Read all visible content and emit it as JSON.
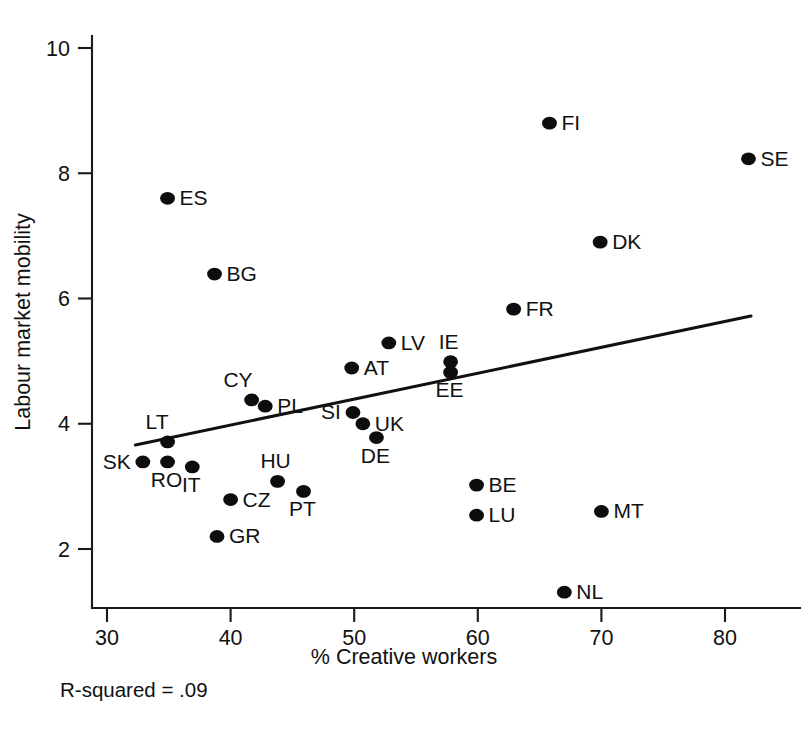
{
  "chart_data": {
    "type": "scatter",
    "title": "",
    "xlabel": "% Creative workers",
    "ylabel": "Labour market mobility",
    "xlim": [
      28.5,
      84.5
    ],
    "ylim": [
      1.0,
      10.6
    ],
    "xticks": [
      30,
      40,
      50,
      60,
      70,
      80
    ],
    "yticks": [
      2,
      4,
      6,
      8,
      10
    ],
    "grid": false,
    "legend": null,
    "annotations": [
      {
        "name": "r-squared-note",
        "text": "R-squared = .09"
      }
    ],
    "trendline": {
      "type": "linear-fit",
      "x_start": 32.3,
      "y_start": 3.66,
      "x_end": 82.1,
      "y_end": 5.72
    },
    "points": [
      {
        "label": "FI",
        "x": 65.8,
        "y": 8.8,
        "label_pos": "right"
      },
      {
        "label": "SE",
        "x": 81.9,
        "y": 8.23,
        "label_pos": "right"
      },
      {
        "label": "ES",
        "x": 34.9,
        "y": 7.6,
        "label_pos": "right"
      },
      {
        "label": "DK",
        "x": 69.9,
        "y": 6.9,
        "label_pos": "right"
      },
      {
        "label": "BG",
        "x": 38.7,
        "y": 6.39,
        "label_pos": "right"
      },
      {
        "label": "FR",
        "x": 62.9,
        "y": 5.83,
        "label_pos": "right"
      },
      {
        "label": "LV",
        "x": 52.8,
        "y": 5.29,
        "label_pos": "right"
      },
      {
        "label": "IE",
        "x": 57.8,
        "y": 4.99,
        "label_pos": "above"
      },
      {
        "label": "AT",
        "x": 49.8,
        "y": 4.89,
        "label_pos": "right"
      },
      {
        "label": "EE",
        "x": 57.8,
        "y": 4.82,
        "label_pos": "below"
      },
      {
        "label": "CY",
        "x": 41.7,
        "y": 4.38,
        "label_pos": "above-left"
      },
      {
        "label": "PL",
        "x": 42.8,
        "y": 4.28,
        "label_pos": "right"
      },
      {
        "label": "SI",
        "x": 49.9,
        "y": 4.18,
        "label_pos": "left"
      },
      {
        "label": "UK",
        "x": 50.7,
        "y": 4.0,
        "label_pos": "right"
      },
      {
        "label": "DE",
        "x": 51.8,
        "y": 3.78,
        "label_pos": "below"
      },
      {
        "label": "LT",
        "x": 34.9,
        "y": 3.71,
        "label_pos": "above-left"
      },
      {
        "label": "SK",
        "x": 32.9,
        "y": 3.39,
        "label_pos": "left"
      },
      {
        "label": "RO",
        "x": 34.9,
        "y": 3.39,
        "label_pos": "below"
      },
      {
        "label": "IT",
        "x": 36.9,
        "y": 3.31,
        "label_pos": "below"
      },
      {
        "label": "HU",
        "x": 43.8,
        "y": 3.08,
        "label_pos": "above"
      },
      {
        "label": "BE",
        "x": 59.9,
        "y": 3.02,
        "label_pos": "right"
      },
      {
        "label": "PT",
        "x": 45.9,
        "y": 2.92,
        "label_pos": "below"
      },
      {
        "label": "CZ",
        "x": 40.0,
        "y": 2.79,
        "label_pos": "right"
      },
      {
        "label": "MT",
        "x": 70.0,
        "y": 2.6,
        "label_pos": "right"
      },
      {
        "label": "LU",
        "x": 59.9,
        "y": 2.54,
        "label_pos": "right"
      },
      {
        "label": "GR",
        "x": 38.9,
        "y": 2.2,
        "label_pos": "right"
      },
      {
        "label": "NL",
        "x": 67.0,
        "y": 1.31,
        "label_pos": "right"
      }
    ]
  },
  "axes": {
    "x_title": "% Creative workers",
    "y_title": "Labour market mobility",
    "x_tick_labels": [
      "30",
      "40",
      "50",
      "60",
      "70",
      "80"
    ],
    "y_tick_labels": [
      "2",
      "4",
      "6",
      "8",
      "10"
    ]
  },
  "footnote": {
    "r_squared_text": "R-squared = .09"
  },
  "colors": {
    "background": "#ffffff",
    "ink": "#111111",
    "point": "#0d0d0d",
    "axis": "#1a1a1a"
  }
}
